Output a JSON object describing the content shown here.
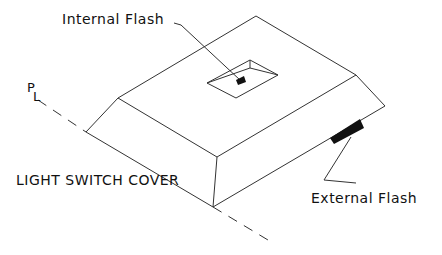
{
  "diagram": {
    "title": "LIGHT SWITCH COVER",
    "labels": {
      "internal_flash": "Internal Flash",
      "external_flash": "External Flash",
      "parting_line_p": "P",
      "parting_line_l": "L"
    },
    "colors": {
      "line": "#333333",
      "fill": "#111111",
      "background": "#ffffff"
    }
  }
}
